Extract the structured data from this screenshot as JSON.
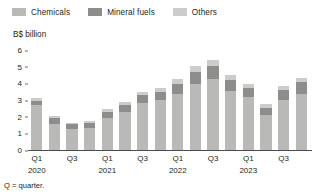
{
  "legend": {
    "position": "top",
    "items": [
      {
        "label": "Chemicals",
        "color": "#b9b9b7",
        "icon": "legend-swatch-icon"
      },
      {
        "label": "Mineral fuels",
        "color": "#8d8d8b",
        "icon": "legend-swatch-icon"
      },
      {
        "label": "Others",
        "color": "#cccccb",
        "icon": "legend-swatch-icon"
      }
    ]
  },
  "axis": {
    "ylabel": "B$ billion",
    "yticks": [
      "0",
      "1",
      "2",
      "3",
      "4",
      "5",
      "6"
    ],
    "xticks": [
      {
        "quarter": "Q1",
        "year": "2020"
      },
      {
        "quarter": "Q3",
        "year": ""
      },
      {
        "quarter": "Q1",
        "year": "2021"
      },
      {
        "quarter": "Q3",
        "year": ""
      },
      {
        "quarter": "Q1",
        "year": "2022"
      },
      {
        "quarter": "Q3",
        "year": ""
      },
      {
        "quarter": "Q1",
        "year": "2023"
      },
      {
        "quarter": "Q3",
        "year": ""
      }
    ]
  },
  "footnote": "Q = quarter.",
  "chart_data": {
    "type": "bar",
    "title": "",
    "subtitle": "",
    "xlabel": "",
    "ylabel": "B$ billion",
    "ylim": [
      0,
      6
    ],
    "grid": false,
    "stacked": true,
    "legend_position": "top",
    "categories": [
      "Q1 2020",
      "Q2 2020",
      "Q3 2020",
      "Q4 2020",
      "Q1 2021",
      "Q2 2021",
      "Q3 2021",
      "Q4 2021",
      "Q1 2022",
      "Q2 2022",
      "Q3 2022",
      "Q4 2022",
      "Q1 2023",
      "Q2 2023",
      "Q3 2023",
      "Q4 2023"
    ],
    "series": [
      {
        "name": "Chemicals",
        "color": "#b9b9b7",
        "values": [
          2.7,
          1.55,
          1.25,
          1.35,
          1.95,
          2.3,
          2.85,
          3.0,
          3.35,
          3.95,
          4.25,
          3.55,
          3.2,
          2.1,
          3.0,
          3.35
        ]
      },
      {
        "name": "Mineral fuels",
        "color": "#8d8d8b",
        "values": [
          0.22,
          0.35,
          0.3,
          0.3,
          0.35,
          0.4,
          0.45,
          0.5,
          0.6,
          0.75,
          0.8,
          0.65,
          0.5,
          0.45,
          0.6,
          0.75
        ]
      },
      {
        "name": "Others",
        "color": "#cccccb",
        "values": [
          0.18,
          0.15,
          0.1,
          0.1,
          0.15,
          0.2,
          0.2,
          0.25,
          0.3,
          0.35,
          0.35,
          0.3,
          0.25,
          0.2,
          0.25,
          0.25
        ]
      }
    ],
    "totals": [
      3.1,
      2.05,
      1.65,
      1.75,
      2.45,
      2.9,
      3.5,
      3.75,
      4.25,
      5.05,
      5.4,
      4.5,
      3.95,
      2.75,
      3.85,
      4.35
    ]
  }
}
